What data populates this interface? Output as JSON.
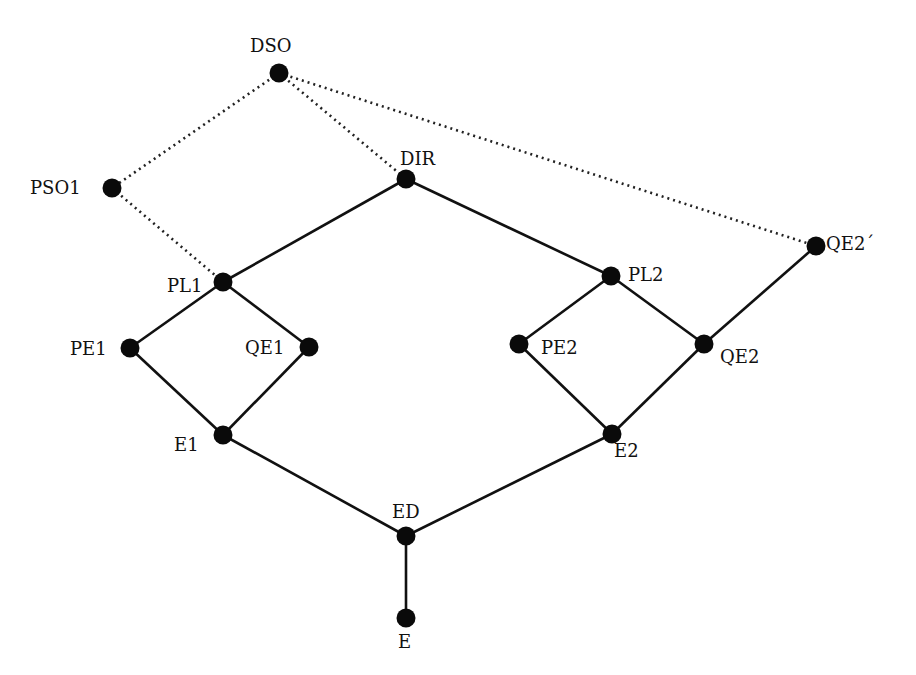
{
  "diagram": {
    "type": "lattice",
    "nodes": [
      {
        "id": "DSO",
        "label": "DSO",
        "x": 279,
        "y": 73,
        "lx": 250,
        "ly": 52,
        "anchor": "start"
      },
      {
        "id": "PSO1",
        "label": "PSO1",
        "x": 112,
        "y": 188,
        "lx": 30,
        "ly": 194,
        "anchor": "start"
      },
      {
        "id": "DIR",
        "label": "DIR",
        "x": 406,
        "y": 179,
        "lx": 400,
        "ly": 165,
        "anchor": "start"
      },
      {
        "id": "QE2p",
        "label": "QE2´",
        "x": 816,
        "y": 246,
        "lx": 826,
        "ly": 250,
        "anchor": "start"
      },
      {
        "id": "PL1",
        "label": "PL1",
        "x": 223,
        "y": 282,
        "lx": 167,
        "ly": 292,
        "anchor": "start"
      },
      {
        "id": "PL2",
        "label": "PL2",
        "x": 611,
        "y": 276,
        "lx": 628,
        "ly": 281,
        "anchor": "start"
      },
      {
        "id": "PE1",
        "label": "PE1",
        "x": 130,
        "y": 348,
        "lx": 70,
        "ly": 355,
        "anchor": "start"
      },
      {
        "id": "QE1",
        "label": "QE1",
        "x": 309,
        "y": 347,
        "lx": 245,
        "ly": 354,
        "anchor": "start"
      },
      {
        "id": "PE2",
        "label": "PE2",
        "x": 519,
        "y": 344,
        "lx": 541,
        "ly": 354,
        "anchor": "start"
      },
      {
        "id": "QE2",
        "label": "QE2",
        "x": 704,
        "y": 344,
        "lx": 720,
        "ly": 363,
        "anchor": "start"
      },
      {
        "id": "E1",
        "label": "E1",
        "x": 223,
        "y": 435,
        "lx": 174,
        "ly": 451,
        "anchor": "start"
      },
      {
        "id": "E2",
        "label": "E2",
        "x": 612,
        "y": 434,
        "lx": 614,
        "ly": 457,
        "anchor": "start"
      },
      {
        "id": "ED",
        "label": "ED",
        "x": 406,
        "y": 536,
        "lx": 392,
        "ly": 518,
        "anchor": "start"
      },
      {
        "id": "E",
        "label": "E",
        "x": 406,
        "y": 618,
        "lx": 398,
        "ly": 648,
        "anchor": "start"
      }
    ],
    "edges_solid": [
      [
        "DIR",
        "PL1"
      ],
      [
        "DIR",
        "PL2"
      ],
      [
        "PL1",
        "PE1"
      ],
      [
        "PL1",
        "QE1"
      ],
      [
        "PE1",
        "E1"
      ],
      [
        "QE1",
        "E1"
      ],
      [
        "PL2",
        "PE2"
      ],
      [
        "PL2",
        "QE2"
      ],
      [
        "PE2",
        "E2"
      ],
      [
        "QE2",
        "E2"
      ],
      [
        "QE2",
        "QE2p"
      ],
      [
        "E1",
        "ED"
      ],
      [
        "E2",
        "ED"
      ],
      [
        "ED",
        "E"
      ]
    ],
    "edges_dotted": [
      [
        "DSO",
        "PSO1"
      ],
      [
        "DSO",
        "DIR"
      ],
      [
        "DSO",
        "QE2p"
      ],
      [
        "PSO1",
        "PL1"
      ]
    ],
    "colors": {
      "node": "#0a0a0a",
      "edge": "#111111",
      "background": "#ffffff"
    }
  }
}
